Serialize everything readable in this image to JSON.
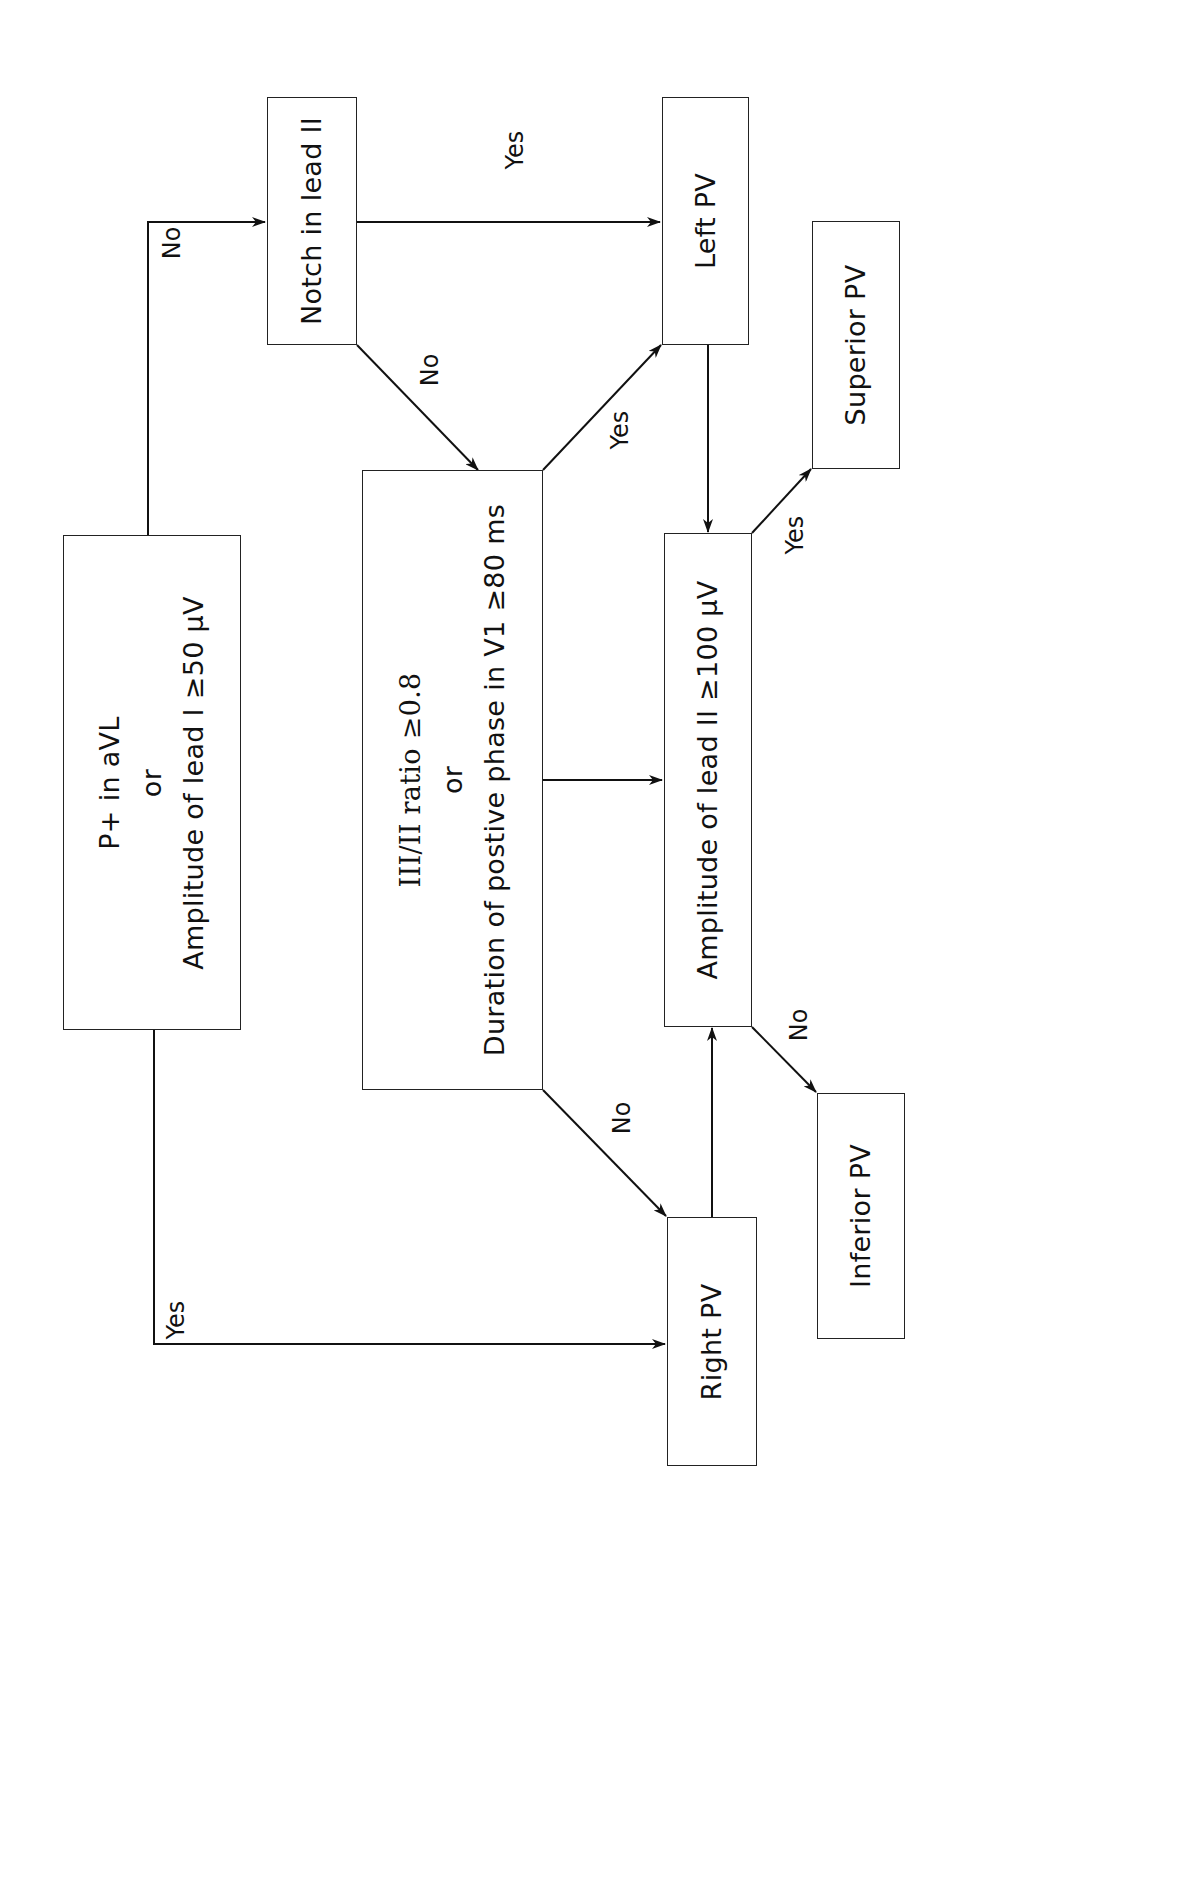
{
  "diagram": {
    "orientation": "rotated-90-ccw",
    "nodes": {
      "start": {
        "line1": "P+ in aVL",
        "line2": "or",
        "line3": "Amplitude of lead I ≥50 μV"
      },
      "notch": {
        "label": "Notch in lead II"
      },
      "ratio": {
        "line1": "III/II ratio ≥0.8",
        "line2": "or",
        "line3": "Duration of postive phase in V1 ≥80 ms"
      },
      "left_pv": {
        "label": "Left PV"
      },
      "amplitude_ii": {
        "label": "Amplitude of lead II ≥100 μV"
      },
      "superior_pv": {
        "label": "Superior PV"
      },
      "inferior_pv": {
        "label": "Inferior PV"
      },
      "right_pv": {
        "label": "Right PV"
      }
    },
    "edge_labels": {
      "start_no": "No",
      "start_yes": "Yes",
      "notch_yes": "Yes",
      "notch_no": "No",
      "ratio_yes": "Yes",
      "ratio_no": "No",
      "amp_yes": "Yes",
      "amp_no": "No"
    },
    "edges": [
      {
        "from": "start",
        "to": "notch",
        "label": "No"
      },
      {
        "from": "start",
        "to": "right_pv",
        "label": "Yes"
      },
      {
        "from": "notch",
        "to": "left_pv",
        "label": "Yes"
      },
      {
        "from": "notch",
        "to": "ratio",
        "label": "No"
      },
      {
        "from": "ratio",
        "to": "left_pv",
        "label": "Yes"
      },
      {
        "from": "ratio",
        "to": "amplitude_ii",
        "label": ""
      },
      {
        "from": "ratio",
        "to": "right_pv",
        "label": "No"
      },
      {
        "from": "left_pv",
        "to": "amplitude_ii",
        "label": ""
      },
      {
        "from": "right_pv",
        "to": "amplitude_ii",
        "label": ""
      },
      {
        "from": "amplitude_ii",
        "to": "superior_pv",
        "label": "Yes"
      },
      {
        "from": "amplitude_ii",
        "to": "inferior_pv",
        "label": "No"
      }
    ],
    "colors": {
      "line": "#222222",
      "background": "#ffffff",
      "text": "#111111"
    }
  }
}
